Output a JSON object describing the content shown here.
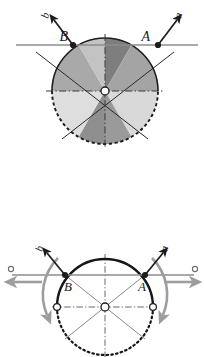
{
  "figure": {
    "panels": [
      {
        "id": "top",
        "name": "sectored-disc",
        "center": {
          "x": 105,
          "y": 91,
          "marker": "open-circle"
        },
        "radius": 53,
        "description": "Circle divided into six 60-degree sectors with alternating gray shades, upper arc solid, lower arc dashed",
        "sector_shades": [
          "#a9a9a9",
          "#c3c3c3",
          "#7e7e7e",
          "#a4a4a4",
          "#d9d9d9",
          "#9a9a9a"
        ],
        "sector_angles_deg": [
          120,
          180,
          60,
          120,
          0,
          60
        ],
        "outline_color": "#1c1c1c",
        "axis_color": "#8c8c8c",
        "points": [
          {
            "label": "A",
            "x": 158,
            "y": 45,
            "marker": "filled-dot"
          },
          {
            "label": "B",
            "x": 73,
            "y": 45,
            "marker": "filled-dot"
          }
        ],
        "vectors": [
          {
            "label": "a",
            "from": {
              "x": 158,
              "y": 45
            },
            "to": {
              "x": 180,
              "y": 17
            },
            "color": "#1c1c1c"
          },
          {
            "label": "b",
            "from": {
              "x": 73,
              "y": 45
            },
            "to": {
              "x": 51,
              "y": 17
            },
            "color": "#1c1c1c"
          }
        ],
        "horizontal_axis": {
          "y": 45,
          "x1": 18,
          "x2": 196,
          "color": "#8c8c8c"
        },
        "vertical_centerline": {
          "x": 105,
          "y1": 36,
          "y2": 146,
          "style": "dash-dot"
        },
        "horizontal_centerline": {
          "y": 91,
          "x1": 48,
          "x2": 162,
          "style": "dash-dot"
        }
      },
      {
        "id": "bottom",
        "name": "velocity-arc-diagram",
        "center": {
          "x": 105,
          "y": 77,
          "marker": "open-circle"
        },
        "radius": 48,
        "description": "Same construction shown with bold solid upper arc, dotted lower arc and gray velocity arrows",
        "outline_color": "#1c1c1c",
        "axis_color": "#8c8c8c",
        "arrow_color": "#9d9d9d",
        "points": [
          {
            "label": "A",
            "x": 145,
            "y": 45,
            "marker": "filled-dot"
          },
          {
            "label": "B",
            "x": 65,
            "y": 45,
            "marker": "filled-dot"
          },
          {
            "label": "",
            "x": 57,
            "y": 77,
            "marker": "open-circle"
          },
          {
            "label": "",
            "x": 153,
            "y": 77,
            "marker": "open-circle"
          }
        ],
        "vectors": [
          {
            "label": "a",
            "from": {
              "x": 145,
              "y": 45
            },
            "to": {
              "x": 166,
              "y": 20
            },
            "color": "#1c1c1c"
          },
          {
            "label": "b",
            "from": {
              "x": 65,
              "y": 45
            },
            "to": {
              "x": 44,
              "y": 20
            },
            "color": "#1c1c1c"
          }
        ],
        "horizontal_axis": {
          "y": 45,
          "x1": 10,
          "x2": 196,
          "color": "#8c8c8c"
        },
        "end_markers": [
          {
            "x": 10,
            "y": 39,
            "marker": "open-circle"
          },
          {
            "x": 196,
            "y": 39,
            "marker": "open-circle"
          }
        ],
        "gray_arrows": [
          {
            "name": "left-linear-arrow",
            "from": {
              "x": 40,
              "y": 52
            },
            "to": {
              "x": 11,
              "y": 52
            }
          },
          {
            "name": "right-linear-arrow",
            "from": {
              "x": 166,
              "y": 52
            },
            "to": {
              "x": 195,
              "y": 52
            }
          },
          {
            "name": "left-curved-arrow",
            "direction": "down"
          },
          {
            "name": "right-curved-arrow",
            "direction": "down"
          }
        ]
      }
    ],
    "labels": {
      "point_a": "A",
      "point_b": "B",
      "vector_a": "a",
      "vector_b": "b"
    }
  }
}
